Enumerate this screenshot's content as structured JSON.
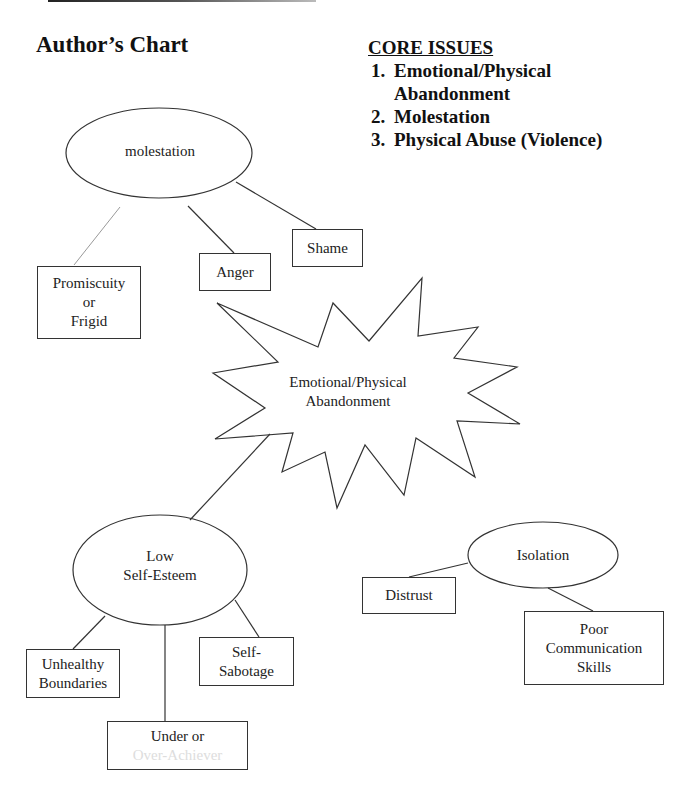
{
  "title": "Author’s Chart",
  "core_issues": {
    "heading": "CORE ISSUES",
    "items": [
      "Emotional/Physical Abandonment",
      "Molestation",
      "Physical Abuse (Violence)"
    ]
  },
  "nodes": {
    "molestation": "molestation",
    "promiscuity": [
      "Promiscuity",
      "or",
      "Frigid"
    ],
    "anger": "Anger",
    "shame": "Shame",
    "abandonment": [
      "Emotional/Physical",
      "Abandonment"
    ],
    "low_self_esteem": [
      "Low",
      "Self-Esteem"
    ],
    "unhealthy_boundaries": [
      "Unhealthy",
      "Boundaries"
    ],
    "self_sabotage": [
      "Self-",
      "Sabotage"
    ],
    "under_over": [
      "Under or",
      "Over-Achiever"
    ],
    "isolation": "Isolation",
    "distrust": "Distrust",
    "poor_communication": [
      "Poor",
      "Communication",
      "Skills"
    ]
  }
}
